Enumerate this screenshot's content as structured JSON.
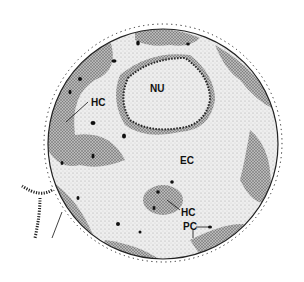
{
  "figure": {
    "type": "schematic drawing of a cell nucleus",
    "labels": {
      "nucleolus": "NU",
      "heterochromatin_left": "HC",
      "heterochromatin_center": "HC",
      "euchromatin": "EC",
      "perichromatin": "PC"
    },
    "colors": {
      "background": "#ffffff",
      "ink": "#111111",
      "light_stipple": "#dcdcdc",
      "dark_stipple": "#8a8a8a"
    }
  }
}
